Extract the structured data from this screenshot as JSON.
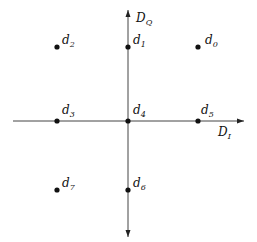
{
  "diagram": {
    "type": "constellation",
    "axes": {
      "horizontal": {
        "label": "D",
        "subscript": "I"
      },
      "vertical": {
        "label": "D",
        "subscript": "Q"
      }
    },
    "points": [
      {
        "id": "d0",
        "label": "d",
        "subscript": "0",
        "x": 198,
        "y": 47
      },
      {
        "id": "d1",
        "label": "d",
        "subscript": "1",
        "x": 128,
        "y": 47
      },
      {
        "id": "d2",
        "label": "d",
        "subscript": "2",
        "x": 57,
        "y": 47
      },
      {
        "id": "d3",
        "label": "d",
        "subscript": "3",
        "x": 57,
        "y": 121
      },
      {
        "id": "d4",
        "label": "d",
        "subscript": "4",
        "x": 128,
        "y": 121
      },
      {
        "id": "d5",
        "label": "d",
        "subscript": "5",
        "x": 198,
        "y": 121
      },
      {
        "id": "d6",
        "label": "d",
        "subscript": "6",
        "x": 128,
        "y": 190
      },
      {
        "id": "d7",
        "label": "d",
        "subscript": "7",
        "x": 57,
        "y": 190
      }
    ],
    "colors": {
      "line": "#333333",
      "dot": "#111111"
    }
  }
}
